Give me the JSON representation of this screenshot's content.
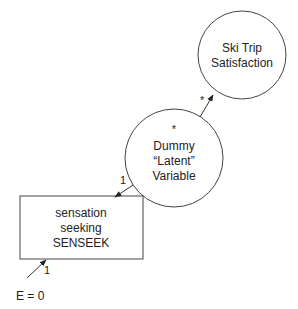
{
  "diagram": {
    "nodes": {
      "ski_trip": {
        "shape": "circle",
        "lines": [
          "Ski Trip",
          "Satisfaction"
        ]
      },
      "dummy": {
        "shape": "circle",
        "marker": "*",
        "lines": [
          "Dummy",
          "“Latent”",
          "Variable"
        ]
      },
      "senseek": {
        "shape": "rectangle",
        "lines": [
          "sensation",
          "seeking",
          "SENSEEK"
        ]
      }
    },
    "edges": {
      "dummy_to_ski": {
        "label": "*"
      },
      "dummy_to_senseek": {
        "label": "1"
      },
      "error_to_senseek": {
        "label": "1"
      }
    },
    "error_term": {
      "label": "E = 0"
    }
  },
  "colors": {
    "stroke": "#333333",
    "background": "#ffffff",
    "text": "#222222"
  }
}
